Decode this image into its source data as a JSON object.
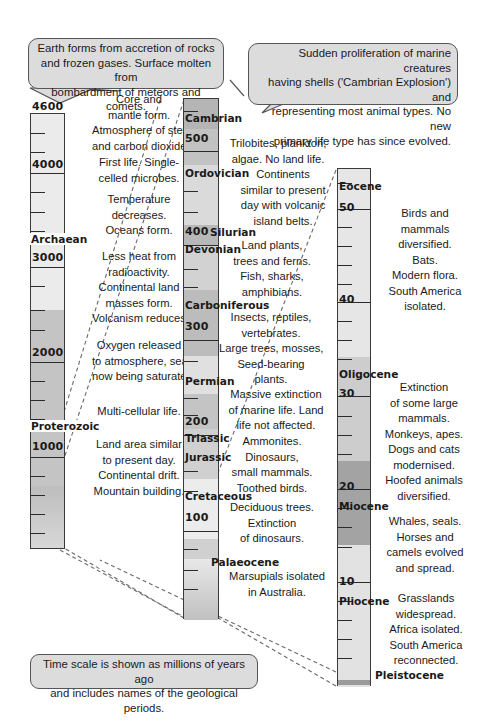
{
  "callouts": {
    "earth_forms": "Earth forms from accretion of rocks and frozen gases. Surface molten from bombardment of meteors and comets.",
    "earth_forms_lines": [
      "Earth forms from accretion of rocks",
      "and frozen gases. Surface molten from",
      "bombardment of meteors and comets."
    ],
    "cambrian_explosion_lines": [
      "Sudden proliferation of marine creatures",
      "having shells ('Cambrian Explosion') and",
      "representing most animal types. No new",
      "primary life type has since evolved."
    ],
    "time_scale_lines": [
      "Time scale is shown as millions of years ago",
      "and includes names of the geological periods."
    ]
  },
  "column1": {
    "labels": [
      "4600",
      "4000",
      "3000",
      "2000",
      "1000"
    ],
    "periods": [
      "Archaean",
      "Proterozoic"
    ],
    "notes": [
      [
        "Core and",
        "mantle form.",
        "Atmosphere of steam",
        "and carbon dioxide."
      ],
      [
        "First life. Single-",
        "celled microbes."
      ],
      [
        "Temperature",
        "decreases.",
        "Oceans form."
      ],
      [
        "Less heat from",
        "radioactivity.",
        "Continental land",
        "masses form.",
        "Volcanism reduces."
      ],
      [
        "Oxygen released",
        "to atmosphere, sea",
        "now being saturated."
      ],
      [
        "Multi-cellular life."
      ],
      [
        "Land area similar",
        "to present day.",
        "Continental drift.",
        "Mountain building."
      ]
    ]
  },
  "column2": {
    "labels": [
      "500",
      "400",
      "300",
      "200",
      "100"
    ],
    "periods": [
      "Cambrian",
      "Ordovician",
      "Silurian",
      "Devonian",
      "Carboniferous",
      "Permian",
      "Triassic",
      "Jurassic",
      "Cretaceous",
      "Palaeocene"
    ],
    "notes": [
      [
        "Trilobites, plankton,",
        "algae. No land life."
      ],
      [
        "Continents",
        "similar to present",
        "day with volcanic",
        "island belts."
      ],
      [
        "Land plants,",
        "trees and ferns.",
        "Fish, sharks,",
        "amphibians."
      ],
      [
        "Insects, reptiles,",
        "vertebrates.",
        "Large trees, mosses,",
        "Seed-bearing",
        "plants."
      ],
      [
        "Massive extinction",
        "of marine life. Land",
        "life not affected."
      ],
      [
        "Ammonites.",
        "Dinosaurs,",
        "small mammals.",
        "Toothed birds."
      ],
      [
        "Deciduous trees.",
        "Extinction",
        "of dinosaurs."
      ],
      [
        "Marsupials isolated",
        "in Australia."
      ]
    ]
  },
  "column3": {
    "labels": [
      "50",
      "40",
      "30",
      "20",
      "10"
    ],
    "periods": [
      "Eocene",
      "Oligocene",
      "Miocene",
      "Pliocene",
      "Pleistocene"
    ],
    "notes": [
      [
        "Birds and",
        "mammals",
        "diversified.",
        "Bats.",
        "Modern flora.",
        "South America",
        "isolated."
      ],
      [
        "Extinction",
        "of some large",
        "mammals.",
        "Monkeys, apes.",
        "Dogs and cats",
        "modernised.",
        "Hoofed animals",
        "diversified."
      ],
      [
        "Whales, seals.",
        "Horses and",
        "camels evolved",
        "and spread."
      ],
      [
        "Grasslands",
        "widespread.",
        "Africa isolated.",
        "South America",
        "reconnected."
      ]
    ]
  },
  "colors": {
    "light": "#ebebeb",
    "mid": "#c9c9c9",
    "dark": "#a9a9a9",
    "callout_fill": "#dcdcdc",
    "border": "#3a3a3a"
  }
}
